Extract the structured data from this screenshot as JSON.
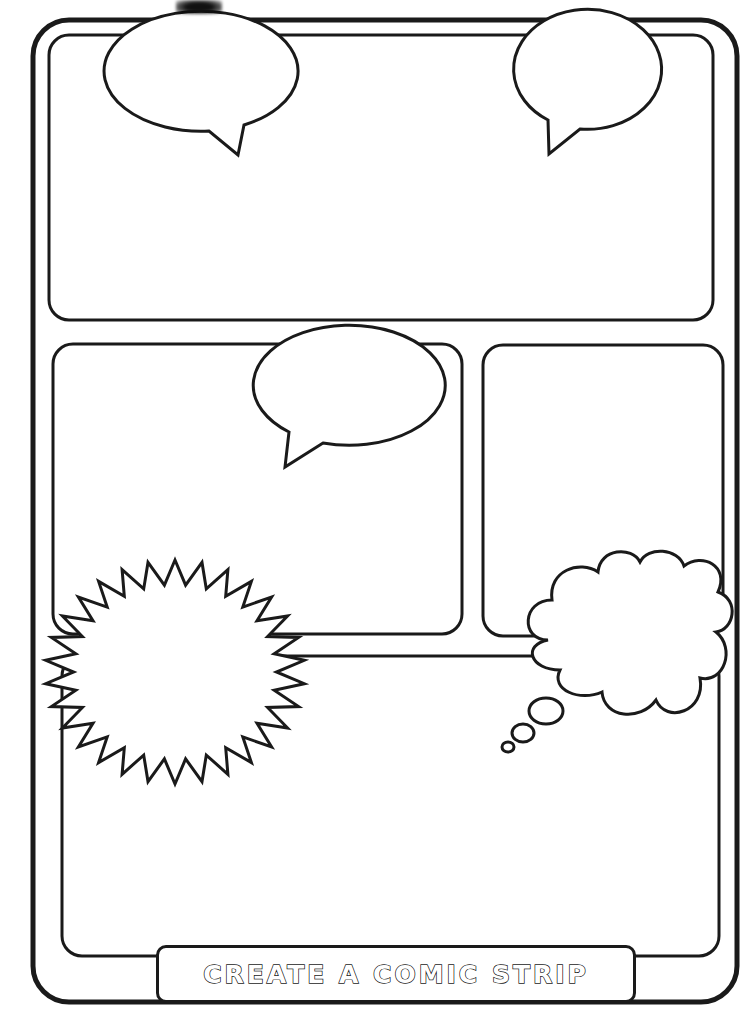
{
  "page": {
    "title": "CREATE A COMIC STRIP",
    "type": "comic strip template worksheet",
    "ink_color": "#1a1a1a",
    "paper_color": "#ffffff"
  },
  "panels": [
    {
      "id": "panel-1",
      "position": "top full-width",
      "x": 49,
      "y": 34,
      "w": 664,
      "h": 286
    },
    {
      "id": "panel-2",
      "position": "middle left",
      "x": 53,
      "y": 344,
      "w": 409,
      "h": 290
    },
    {
      "id": "panel-3",
      "position": "middle right",
      "x": 483,
      "y": 344,
      "w": 240,
      "h": 292
    },
    {
      "id": "panel-4",
      "position": "bottom full-width",
      "x": 62,
      "y": 656,
      "w": 657,
      "h": 300
    }
  ],
  "balloons": [
    {
      "id": "speech-balloon-top-left",
      "kind": "speech",
      "cx": 200,
      "cy": 66,
      "rx": 97,
      "ry": 60
    },
    {
      "id": "speech-balloon-top-right",
      "kind": "speech",
      "cx": 580,
      "cy": 69,
      "rx": 74,
      "ry": 60
    },
    {
      "id": "speech-balloon-middle",
      "kind": "speech",
      "cx": 345,
      "cy": 383,
      "rx": 96,
      "ry": 60
    },
    {
      "id": "burst-balloon",
      "kind": "burst",
      "cx": 175,
      "cy": 672,
      "spikes": 30
    },
    {
      "id": "thought-cloud",
      "kind": "thought",
      "cx": 625,
      "cy": 635
    }
  ]
}
